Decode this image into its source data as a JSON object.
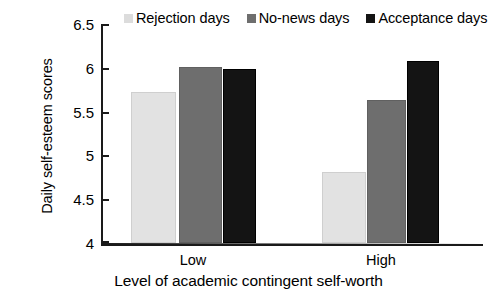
{
  "chart_data": {
    "type": "bar",
    "title": "",
    "xlabel": "Level of academic contingent self-worth",
    "ylabel": "Daily self-esteem scores",
    "categories": [
      "Low",
      "High"
    ],
    "series": [
      {
        "name": "Rejection days",
        "color": "#e2e2e2",
        "values": [
          5.73,
          4.81
        ]
      },
      {
        "name": "No-news days",
        "color": "#6e6e6e",
        "values": [
          6.01,
          5.63
        ]
      },
      {
        "name": "Acceptance days",
        "color": "#141414",
        "values": [
          5.99,
          6.08
        ]
      }
    ],
    "ylim": [
      4,
      6.5
    ],
    "yticks": [
      4,
      4.5,
      5,
      5.5,
      6,
      6.5
    ],
    "ytick_labels": [
      "4",
      "4.5",
      "5",
      "5.5",
      "6",
      "6.5"
    ],
    "grid": false,
    "legend_position": "top"
  },
  "axis": {
    "y_title": "Daily self-esteem scores",
    "x_title": "Level of academic contingent self-worth",
    "ticks": [
      {
        "value": "6.5"
      },
      {
        "value": "6"
      },
      {
        "value": "5.5"
      },
      {
        "value": "5"
      },
      {
        "value": "4.5"
      },
      {
        "value": "4"
      }
    ]
  },
  "groups": [
    {
      "label": "Low"
    },
    {
      "label": "High"
    }
  ],
  "legend": {
    "items": [
      {
        "label": "Rejection days",
        "swatch": "legend-swatch-rejection"
      },
      {
        "label": "No-news days",
        "swatch": "legend-swatch-no-news"
      },
      {
        "label": "Acceptance days",
        "swatch": "legend-swatch-acceptance"
      }
    ]
  }
}
